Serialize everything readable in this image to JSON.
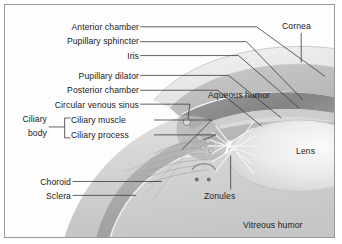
{
  "figure": {
    "background_color": "#fdfdfd",
    "border_color": "#9a9a9a",
    "text_color": "#1a1a1a",
    "leader_color": "#3a3a3a"
  },
  "labels": {
    "anterior_chamber": "Anterior chamber",
    "pupillary_sphincter": "Pupillary sphincter",
    "iris": "Iris",
    "pupillary_dilator": "Pupillary dilator",
    "posterior_chamber": "Posterior chamber",
    "circular_venous_sinus": "Circular venous sinus",
    "ciliary_body_line1": "Ciliary",
    "ciliary_body_line2": "body",
    "ciliary_muscle": "Ciliary muscle",
    "ciliary_process": "Ciliary process",
    "choroid": "Choroid",
    "sclera": "Sclera",
    "cornea": "Cornea",
    "aqueous_humor": "Aqueous humor",
    "lens": "Lens",
    "zonules": "Zonules",
    "vitreous_humor": "Vitreous humor"
  },
  "anatomy_colors": {
    "sclera_outer": "#dcdcdc",
    "sclera_inner": "#cfcfcf",
    "choroid": "#a8a8a8",
    "iris": "#8d8d8d",
    "cornea": "#ededed",
    "lens": "#e6e6e6",
    "vitreous": "#cccccc",
    "aqueous": "#bdbdbd",
    "zonule_fiber": "#f4f4f4"
  },
  "structures": [
    {
      "name": "cornea",
      "region": "anterior outer transparent dome"
    },
    {
      "name": "anterior-chamber",
      "region": "between cornea and iris"
    },
    {
      "name": "iris",
      "region": "dark band anterior to lens"
    },
    {
      "name": "posterior-chamber",
      "region": "between iris and lens"
    },
    {
      "name": "ciliary-body",
      "region": "ring at iris root"
    },
    {
      "name": "lens",
      "region": "central biconvex body, right"
    },
    {
      "name": "zonules",
      "region": "crossing fibers lens to ciliary body"
    },
    {
      "name": "choroid",
      "region": "mid vascular layer"
    },
    {
      "name": "sclera",
      "region": "outer white fibrous coat"
    },
    {
      "name": "vitreous-humor",
      "region": "large posterior cavity"
    }
  ]
}
